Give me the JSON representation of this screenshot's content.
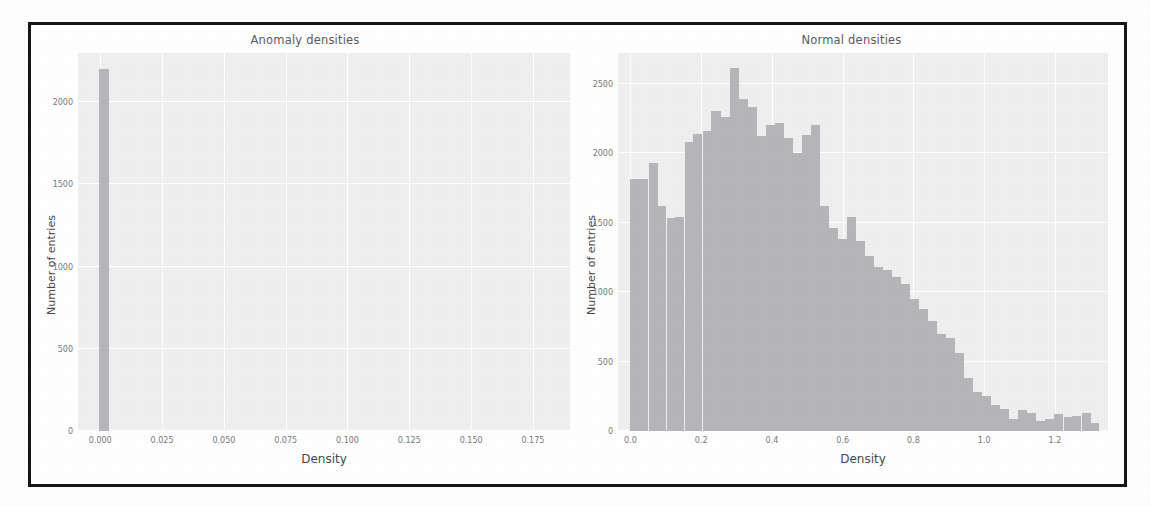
{
  "figure": {
    "background_color": "#ffffff",
    "frame_color": "#16161a",
    "axes_background": "#f0eff0",
    "grid_color": "#ffffff",
    "bar_color": "#b6b6ba"
  },
  "chart_data": [
    {
      "type": "bar",
      "title": "Anomaly densities",
      "xlabel": "Density",
      "ylabel": "Number of entries",
      "xlim": [
        -0.009,
        0.19
      ],
      "ylim": [
        0,
        2300
      ],
      "grid": true,
      "legend": "none",
      "xticks": [
        "0.000",
        "0.025",
        "0.050",
        "0.075",
        "0.100",
        "0.125",
        "0.150",
        "0.175"
      ],
      "xtick_values": [
        0.0,
        0.025,
        0.05,
        0.075,
        0.1,
        0.125,
        0.15,
        0.175
      ],
      "yticks": [
        "0",
        "500",
        "1000",
        "1500",
        "2000"
      ],
      "ytick_values": [
        0,
        500,
        1000,
        1500,
        2000
      ],
      "bin_width": 0.0038,
      "x": [
        0.0015
      ],
      "values": [
        2200
      ],
      "note": "Single spike bin at density ~0.000 containing essentially all anomaly entries"
    },
    {
      "type": "bar",
      "title": "Normal densities",
      "xlabel": "Density",
      "ylabel": "Number of entries",
      "xlim": [
        -0.035,
        1.35
      ],
      "ylim": [
        0,
        2720
      ],
      "grid": true,
      "legend": "none",
      "xticks": [
        "0.0",
        "0.2",
        "0.4",
        "0.6",
        "0.8",
        "1.0",
        "1.2"
      ],
      "xtick_values": [
        0.0,
        0.2,
        0.4,
        0.6,
        0.8,
        1.0,
        1.2
      ],
      "yticks": [
        "0",
        "500",
        "1000",
        "1500",
        "2000",
        "2500"
      ],
      "ytick_values": [
        0,
        500,
        1000,
        1500,
        2000,
        2500
      ],
      "bin_width": 0.0255,
      "x": [
        0.013,
        0.038,
        0.064,
        0.089,
        0.115,
        0.14,
        0.166,
        0.191,
        0.217,
        0.242,
        0.268,
        0.293,
        0.319,
        0.344,
        0.37,
        0.395,
        0.421,
        0.446,
        0.472,
        0.497,
        0.523,
        0.548,
        0.574,
        0.599,
        0.625,
        0.65,
        0.676,
        0.701,
        0.727,
        0.752,
        0.778,
        0.803,
        0.829,
        0.854,
        0.88,
        0.905,
        0.931,
        0.956,
        0.982,
        1.007,
        1.033,
        1.058,
        1.084,
        1.109,
        1.135,
        1.16,
        1.186,
        1.211,
        1.237,
        1.262,
        1.288,
        1.313
      ],
      "values": [
        1810,
        1810,
        1930,
        1620,
        1530,
        1540,
        2080,
        2140,
        2160,
        2300,
        2260,
        2610,
        2390,
        2330,
        2120,
        2200,
        2220,
        2110,
        2000,
        2130,
        2200,
        1620,
        1460,
        1380,
        1540,
        1370,
        1260,
        1180,
        1160,
        1110,
        1060,
        950,
        880,
        790,
        700,
        670,
        560,
        380,
        280,
        250,
        190,
        160,
        90,
        150,
        130,
        70,
        90,
        120,
        100,
        110,
        130,
        60
      ],
      "note": "Right-skewed unimodal distribution peaking near density 0.29 with a long tail to 1.3"
    }
  ]
}
